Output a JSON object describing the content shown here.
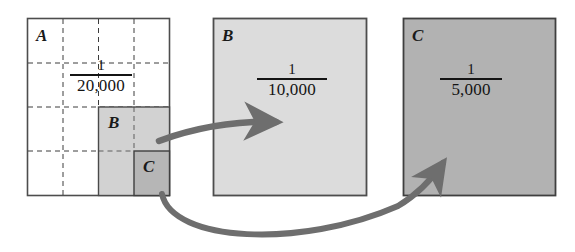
{
  "figure": {
    "background": "#ffffff"
  },
  "panels": [
    {
      "id": "A",
      "label": "A",
      "scale_numerator": "1",
      "scale_denominator": "20,000",
      "fill": "#ffffff",
      "stroke": "#4d4d4d",
      "grid": {
        "rows": 4,
        "cols": 4,
        "style": "dashed",
        "color": "#3c3c3c"
      }
    },
    {
      "id": "B",
      "label": "B",
      "scale_numerator": "1",
      "scale_denominator": "10,000",
      "fill": "#dcdcdc",
      "stroke": "#4d4d4d"
    },
    {
      "id": "C",
      "label": "C",
      "scale_numerator": "1",
      "scale_denominator": "5,000",
      "fill": "#b2b2b2",
      "stroke": "#3f3f3f"
    }
  ],
  "inset_squares": [
    {
      "id": "B-inset",
      "label": "B",
      "fill": "#d2d2d2",
      "stroke": "#4a4a4a",
      "parent": "A"
    },
    {
      "id": "C-inset",
      "label": "C",
      "fill": "#b6b6b6",
      "stroke": "#3f3f3f",
      "parent": "A"
    }
  ],
  "arrows": [
    {
      "id": "arrow-b",
      "from": "B-inset",
      "to": "B",
      "color": "#6e6e6e",
      "shape": "curved-right"
    },
    {
      "id": "arrow-c",
      "from": "C-inset",
      "to": "C",
      "color": "#6e6e6e",
      "shape": "curved-swoop-right"
    }
  ],
  "colors": {
    "ink": "#141414",
    "panel_stroke": "#4d4d4d",
    "grid_dash": "#3c3c3c",
    "arrow": "#6e6e6e",
    "fill_light": "#dcdcdc",
    "fill_mid": "#d2d2d2",
    "fill_dark": "#b2b2b2"
  }
}
